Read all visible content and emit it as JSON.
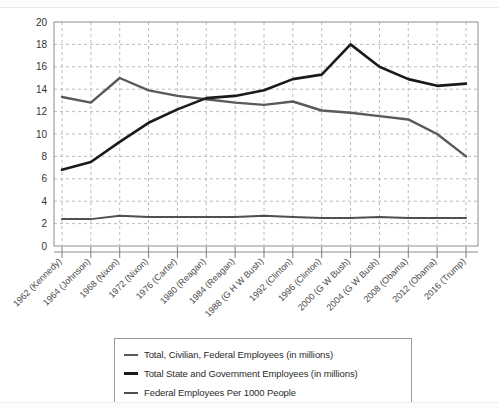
{
  "chart_data": {
    "type": "line",
    "title": "",
    "subtitle": "",
    "xlabel": "",
    "ylabel": "",
    "ylim": [
      0,
      20
    ],
    "ytick_step": 2,
    "yticks": [
      0,
      2,
      4,
      6,
      8,
      10,
      12,
      14,
      16,
      18,
      20
    ],
    "grid": true,
    "grid_style": "dashed",
    "legend_position": "below-center",
    "categories": [
      "1962 (Kennedy)",
      "1964 (Johnson)",
      "1968 (Nixon)",
      "1972 (Nixon)",
      "1976 (Carter)",
      "1980 (Reagan)",
      "1984 (Reagan)",
      "1988 (G H W Bush)",
      "1992 (Clinton)",
      "1996 (Clinton)",
      "2000 (G W Bush)",
      "2004 (G W Bush)",
      "2008 (Obama)",
      "2012 (Obama)",
      "2016 (Trump)"
    ],
    "series": [
      {
        "name": "Total, Civilian, Federal Employees (in millions)",
        "color": "#5a5a5a",
        "width": 2.4,
        "values": [
          13.3,
          12.8,
          15.0,
          13.9,
          13.4,
          13.1,
          12.8,
          12.6,
          12.9,
          12.1,
          11.9,
          11.6,
          11.3,
          10.0,
          8.0
        ]
      },
      {
        "name": "Total State and Government Employees (in millions)",
        "color": "#1a1a1a",
        "width": 2.6,
        "values": [
          6.8,
          7.5,
          9.3,
          11.0,
          12.2,
          13.2,
          13.4,
          13.9,
          14.9,
          15.3,
          18.0,
          16.0,
          14.9,
          14.3,
          14.5
        ]
      },
      {
        "name": "Federal Employees Per 1000 People",
        "color": "#4f4f4f",
        "width": 2.0,
        "values": [
          2.4,
          2.4,
          2.7,
          2.6,
          2.6,
          2.6,
          2.6,
          2.7,
          2.6,
          2.5,
          2.5,
          2.6,
          2.5,
          2.5,
          2.5
        ]
      }
    ]
  },
  "legend": {
    "items": [
      {
        "label": "Total, Civilian, Federal Employees (in millions)",
        "color": "#5a5a5a",
        "width": "2.4px"
      },
      {
        "label": "Total State and Government Employees (in millions)",
        "color": "#1a1a1a",
        "width": "3px"
      },
      {
        "label": "Federal Employees Per 1000 People",
        "color": "#4f4f4f",
        "width": "2px"
      }
    ]
  }
}
